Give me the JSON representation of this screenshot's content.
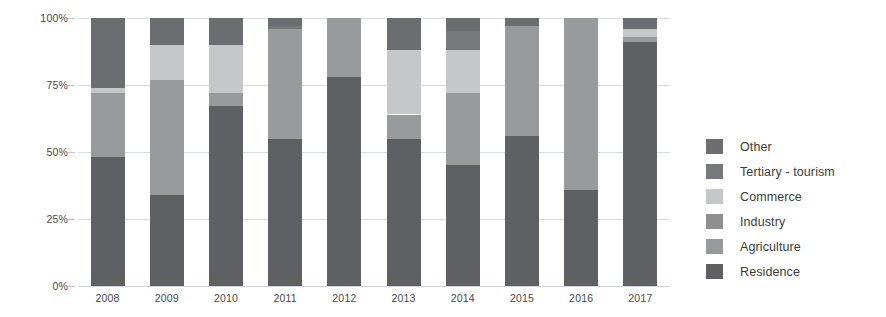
{
  "chart_data": {
    "type": "bar",
    "subtype": "stacked-percentage",
    "title": "",
    "xlabel": "",
    "ylabel": "",
    "ylim": [
      0,
      100
    ],
    "ytick_labels": [
      "100%",
      "75%",
      "50%",
      "25%",
      "0%"
    ],
    "ytick_values": [
      100,
      75,
      50,
      25,
      0
    ],
    "grid": true,
    "legend_position": "right",
    "categories": [
      "2008",
      "2009",
      "2010",
      "2011",
      "2012",
      "2013",
      "2014",
      "2015",
      "2016",
      "2017"
    ],
    "series": [
      {
        "name": "Residence",
        "color": "#5f6063",
        "values": [
          48,
          34,
          67,
          55,
          78,
          55,
          45,
          56,
          36,
          91
        ]
      },
      {
        "name": "Agriculture",
        "color": "#989a9c",
        "values": [
          24,
          43,
          5,
          41,
          22,
          9,
          27,
          41,
          64,
          2
        ]
      },
      {
        "name": "Industry",
        "color": "#8d8f91",
        "values": [
          0,
          0,
          0,
          0,
          0,
          0,
          0,
          0,
          0,
          0
        ]
      },
      {
        "name": "Commerce",
        "color": "#c5c7c9",
        "values": [
          2,
          13,
          18,
          0,
          0,
          24,
          16,
          0,
          0,
          3
        ]
      },
      {
        "name": "Tertiary - tourism",
        "color": "#76787b",
        "values": [
          0,
          0,
          0,
          1,
          0,
          0,
          7,
          0,
          0,
          0
        ]
      },
      {
        "name": "Other",
        "color": "#6b6d70",
        "values": [
          26,
          10,
          10,
          3,
          0,
          12,
          5,
          3,
          0,
          4
        ]
      }
    ]
  },
  "legend": {
    "items": [
      {
        "label": "Other",
        "color": "#6b6d70"
      },
      {
        "label": "Tertiary - tourism",
        "color": "#76787b"
      },
      {
        "label": "Commerce",
        "color": "#c5c7c9"
      },
      {
        "label": "Industry",
        "color": "#8d8f91"
      },
      {
        "label": "Agriculture",
        "color": "#989a9c"
      },
      {
        "label": "Residence",
        "color": "#5f6063"
      }
    ]
  },
  "colors": {
    "gridline": "#d8dde3",
    "axis_text": "#4a4a4a",
    "background": "#ffffff"
  }
}
